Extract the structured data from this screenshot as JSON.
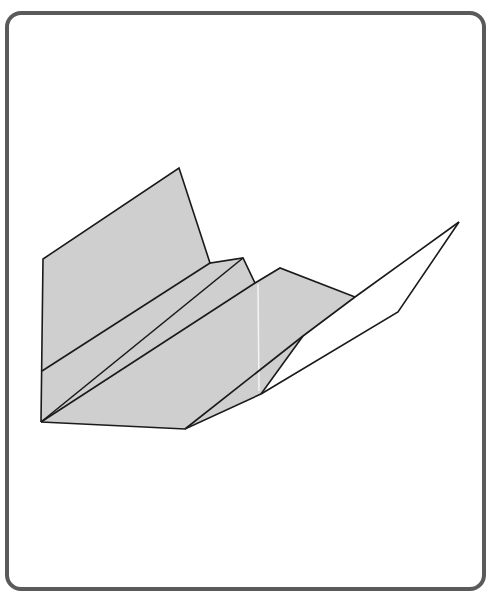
{
  "figure": {
    "colors": {
      "frame_border": "#5a5a5a",
      "paper_gray": "#cfcfcf",
      "paper_white": "#ffffff",
      "fold_line": "#1a1a1a",
      "highlight_line": "#f4f4f4"
    },
    "polygons": {
      "left_wing_panel": "43,259 179,168 210,263 243,258 255,283 280,268 355,297 303,336 261,394 185,429 41,422",
      "right_wing_white": "355,297 459,222 398,312 261,394 303,336"
    },
    "lines": [
      {
        "name": "left-wing-outline",
        "points": "41,422 43,259 179,168 210,263 243,258 255,283 280,268 355,297"
      },
      {
        "name": "upper-fold-line",
        "points": "42,371 210,263"
      },
      {
        "name": "middle-fold-line",
        "points": "41,422 243,258"
      },
      {
        "name": "keel-fold-line",
        "points": "41,422 255,283"
      },
      {
        "name": "right-wing-leading-edge",
        "points": "185,429 303,336 355,297 459,222"
      },
      {
        "name": "right-wing-trailing-edge",
        "points": "459,222 398,312 261,394"
      },
      {
        "name": "body-crease",
        "points": "303,336 261,394"
      },
      {
        "name": "bottom-edge",
        "points": "41,422 185,429 261,394"
      }
    ],
    "highlight": {
      "x1": 258,
      "y1": 284,
      "x2": 259,
      "y2": 391
    }
  }
}
